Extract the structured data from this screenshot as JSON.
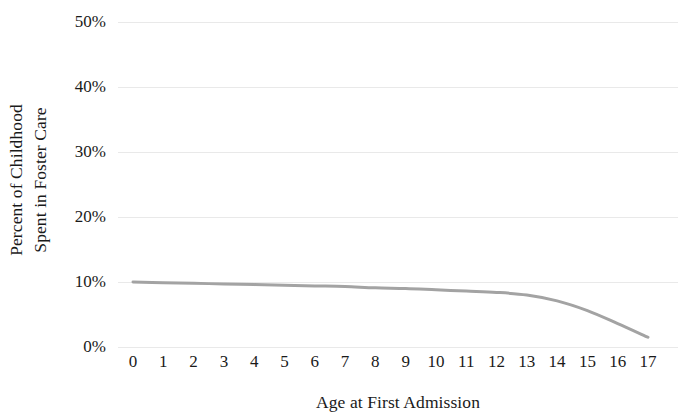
{
  "chart_data": {
    "type": "line",
    "title": "",
    "xlabel": "Age at First Admission",
    "ylabel": "Percent of Childhood Spent in Foster Care",
    "ylabel_lines": [
      "Percent of Childhood",
      "Spent in Foster Care"
    ],
    "x": [
      0,
      1,
      2,
      3,
      4,
      5,
      6,
      7,
      8,
      9,
      10,
      11,
      12,
      13,
      14,
      15,
      16,
      17
    ],
    "xtick_labels": [
      "0",
      "1",
      "2",
      "3",
      "4",
      "5",
      "6",
      "7",
      "8",
      "9",
      "10",
      "11",
      "12",
      "13",
      "14",
      "15",
      "16",
      "17"
    ],
    "values": [
      10.0,
      9.9,
      9.8,
      9.7,
      9.6,
      9.5,
      9.4,
      9.3,
      9.1,
      9.0,
      8.8,
      8.6,
      8.4,
      8.0,
      7.1,
      5.6,
      3.6,
      1.5
    ],
    "series": [
      {
        "name": "Percent of Childhood Spent in Foster Care",
        "values": [
          10.0,
          9.9,
          9.8,
          9.7,
          9.6,
          9.5,
          9.4,
          9.3,
          9.1,
          9.0,
          8.8,
          8.6,
          8.4,
          8.0,
          7.1,
          5.6,
          3.6,
          1.5
        ],
        "color": "#a3a3a3"
      }
    ],
    "ylim": [
      0,
      50
    ],
    "xlim": [
      0,
      17
    ],
    "ytick_values": [
      0,
      10,
      20,
      30,
      40,
      50
    ],
    "ytick_labels": [
      "0%",
      "10%",
      "20%",
      "30%",
      "40%",
      "50%"
    ],
    "grid": true,
    "grid_axis": "y",
    "grid_color": "#e9e9e9",
    "legend": false,
    "legend_position": "none",
    "line_color": "#a3a3a3",
    "line_width": 3,
    "background_color": "#ffffff",
    "text_color": "#1a1a1a"
  }
}
